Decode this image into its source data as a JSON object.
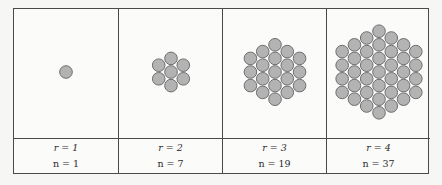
{
  "diagram": {
    "type": "hexagonal-circle-packing-table",
    "colors": {
      "circle_fill": "#b3b3b3",
      "circle_stroke": "#6e6e6e",
      "border": "#4a4a4a",
      "background": "#fbfbfa"
    },
    "columns": [
      {
        "r_label": "r = 1",
        "n_label": "n = 1",
        "r": 1,
        "n": 1
      },
      {
        "r_label": "r = 2",
        "n_label": "n = 7",
        "r": 2,
        "n": 7
      },
      {
        "r_label": "r = 3",
        "n_label": "n = 19",
        "r": 3,
        "n": 19
      },
      {
        "r_label": "r = 4",
        "n_label": "n = 37",
        "r": 4,
        "n": 37
      }
    ]
  }
}
